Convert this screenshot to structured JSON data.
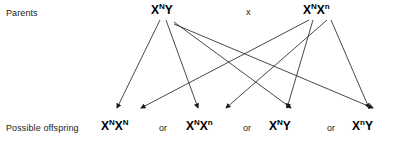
{
  "diagram": {
    "background_color": "#ffffff",
    "line_color": "#333333",
    "text_color": "#000000",
    "rows": {
      "parents_label": "Parents",
      "offspring_label": "Possible offspring"
    },
    "cross_symbol": "x",
    "separator": "or",
    "parents": [
      {
        "id": "parent-male",
        "base": "X",
        "superscript_1": "N",
        "allele_2": "Y",
        "superscript_2": "",
        "full_text": "XNY"
      },
      {
        "id": "parent-female",
        "base": "X",
        "superscript_1": "N",
        "allele_2": "X",
        "superscript_2": "n",
        "full_text": "XNXn"
      }
    ],
    "offspring": [
      {
        "id": "offspring-0",
        "base": "X",
        "superscript_1": "N",
        "allele_2": "X",
        "superscript_2": "N",
        "full_text": "XNXN"
      },
      {
        "id": "offspring-1",
        "base": "X",
        "superscript_1": "N",
        "allele_2": "X",
        "superscript_2": "n",
        "full_text": "XNXn"
      },
      {
        "id": "offspring-2",
        "base": "X",
        "superscript_1": "N",
        "allele_2": "Y",
        "superscript_2": "",
        "full_text": "XNY"
      },
      {
        "id": "offspring-3",
        "base": "X",
        "superscript_1": "n",
        "allele_2": "Y",
        "superscript_2": "",
        "full_text": "XnY"
      }
    ],
    "separators": [
      "or",
      "or",
      "or"
    ],
    "arrows": [
      {
        "name": "male-XN-to-offspring-0",
        "x1": 160,
        "y1": 20,
        "x2": 117,
        "y2": 108
      },
      {
        "name": "male-Y-to-offspring-1",
        "x1": 166,
        "y1": 20,
        "x2": 198,
        "y2": 108
      },
      {
        "name": "female-XN-to-offspring-1",
        "x1": 309,
        "y1": 20,
        "x2": 141,
        "y2": 108
      },
      {
        "name": "female-Xn-to-offspring-2",
        "x1": 327,
        "y1": 20,
        "x2": 226,
        "y2": 108
      },
      {
        "name": "female-XN-to-offspring-2",
        "x1": 313,
        "y1": 20,
        "x2": 287,
        "y2": 108
      },
      {
        "name": "female-Xn-to-offspring-3",
        "x1": 331,
        "y1": 20,
        "x2": 369,
        "y2": 108
      },
      {
        "name": "male-XN-cross-to-offspring-2",
        "x1": 174,
        "y1": 22,
        "x2": 291,
        "y2": 108
      },
      {
        "name": "male-Y-cross-to-offspring-3",
        "x1": 174,
        "y1": 24,
        "x2": 373,
        "y2": 108
      }
    ]
  }
}
